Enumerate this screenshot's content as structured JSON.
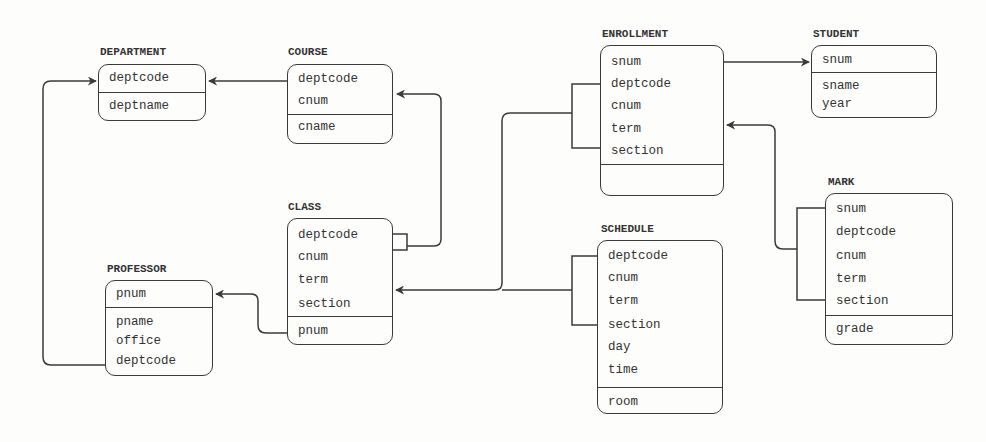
{
  "diagram": {
    "type": "relational-schema",
    "colors": {
      "line": "#3a3a3a",
      "text": "#333333",
      "background": "#fdfdfc"
    },
    "entities": {
      "department": {
        "name": "DEPARTMENT",
        "key": [
          "deptcode"
        ],
        "attributes": [
          "deptname"
        ]
      },
      "course": {
        "name": "COURSE",
        "key": [
          "deptcode",
          "cnum"
        ],
        "attributes": [
          "cname"
        ]
      },
      "class": {
        "name": "CLASS",
        "key": [
          "deptcode",
          "cnum",
          "term",
          "section"
        ],
        "attributes": [
          "pnum"
        ]
      },
      "professor": {
        "name": "PROFESSOR",
        "key": [
          "pnum"
        ],
        "attributes": [
          "pname",
          "office",
          "deptcode"
        ]
      },
      "enrollment": {
        "name": "ENROLLMENT",
        "key": [
          "snum",
          "deptcode",
          "cnum",
          "term",
          "section"
        ],
        "attributes": []
      },
      "student": {
        "name": "STUDENT",
        "key": [
          "snum"
        ],
        "attributes": [
          "sname",
          "year"
        ]
      },
      "schedule": {
        "name": "SCHEDULE",
        "key": [
          "deptcode",
          "cnum",
          "term",
          "section",
          "day",
          "time"
        ],
        "attributes": [
          "room"
        ]
      },
      "mark": {
        "name": "MARK",
        "key": [
          "snum",
          "deptcode",
          "cnum",
          "term",
          "section"
        ],
        "attributes": [
          "grade"
        ]
      }
    },
    "relationships": [
      {
        "from": "COURSE.deptcode",
        "to": "DEPARTMENT.deptcode"
      },
      {
        "from": "CLASS.(deptcode,cnum)",
        "to": "COURSE"
      },
      {
        "from": "CLASS.pnum",
        "to": "PROFESSOR.pnum"
      },
      {
        "from": "PROFESSOR.deptcode",
        "to": "DEPARTMENT.deptcode"
      },
      {
        "from": "ENROLLMENT.snum",
        "to": "STUDENT.snum"
      },
      {
        "from": "ENROLLMENT.(deptcode,cnum,term,section)",
        "to": "CLASS"
      },
      {
        "from": "SCHEDULE.(deptcode,cnum,term,section)",
        "to": "CLASS"
      },
      {
        "from": "MARK.(snum,deptcode,cnum,term,section)",
        "to": "ENROLLMENT"
      }
    ]
  }
}
